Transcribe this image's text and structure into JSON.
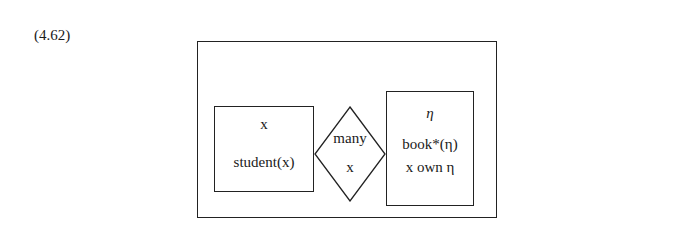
{
  "equation_number": "(4.62)",
  "drs": {
    "left_box": {
      "referent": "x",
      "conditions": [
        "student(x)"
      ]
    },
    "quantifier": {
      "label": "many",
      "variable": "x"
    },
    "right_box": {
      "referent": "η",
      "conditions": [
        "book*(η)",
        "x own η"
      ]
    }
  }
}
